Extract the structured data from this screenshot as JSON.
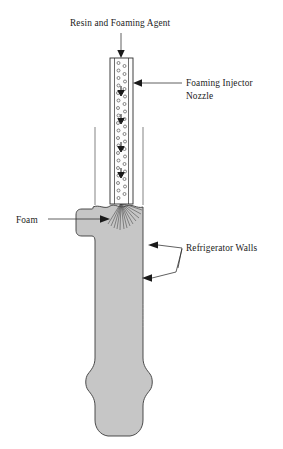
{
  "figure": {
    "title_caption": "",
    "background_color": "#ffffff",
    "wall_fill_color": "#c6c6c6",
    "wall_stroke_color": "#3a3a3a",
    "nozzle_fill_color": "#fdfdfd",
    "nozzle_stroke_color": "#2c2c2c",
    "ink_color": "#1a1a1a"
  },
  "labels": {
    "inlet": {
      "text": "Resin and Foaming Agent",
      "x": 70,
      "y": 26
    },
    "nozzle_line1": {
      "text": "Foaming Injector",
      "x": 186,
      "y": 86
    },
    "nozzle_line2": {
      "text": "Nozzle",
      "x": 186,
      "y": 99
    },
    "foam": {
      "text": "Foam",
      "x": 16,
      "y": 221
    },
    "walls": {
      "text": "Refrigerator Walls",
      "x": 186,
      "y": 251
    }
  },
  "components": {
    "nozzle": {
      "name": "Foaming Injector Nozzle",
      "bubble_count": 52,
      "internal_arrow_count": 5,
      "tube_top_y": 58,
      "tube_bottom_y": 202,
      "tube_left_x": 110,
      "tube_right_x": 133
    },
    "spray": {
      "name": "foam spray plume",
      "ray_count": 13,
      "origin_x": 121,
      "origin_y": 203
    },
    "cavity": {
      "name": "refrigerator wall cavity",
      "foam_surface_y": 207
    }
  },
  "annotations": {
    "inlet_arrow": "down-arrow",
    "nozzle_arrow": "left-arrow",
    "foam_arrow": "right-arrow",
    "wall_arrow_upper": "left-arrow",
    "wall_arrow_lower": "left-arrow"
  }
}
